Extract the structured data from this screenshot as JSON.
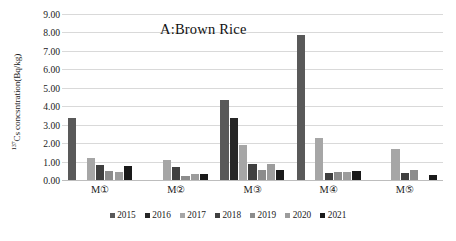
{
  "chart_data": {
    "type": "bar",
    "title": "A:Brown Rice",
    "xlabel": "",
    "ylabel": "137Cs concsntration(Bq/kg)",
    "ylabel_sup": "137",
    "ylabel_rest": "Cs concsntration(Bq/kg)",
    "categories": [
      "M①",
      "M②",
      "M③",
      "M④",
      "M⑤"
    ],
    "ylim": [
      0,
      9
    ],
    "ytick_step": 1,
    "ytick_labels": [
      "0.00",
      "1.00",
      "2.00",
      "3.00",
      "4.00",
      "5.00",
      "6.00",
      "7.00",
      "8.00",
      "9.00"
    ],
    "grid": true,
    "legend_position": "bottom",
    "series": [
      {
        "name": "2015",
        "color": "#595959",
        "values": [
          3.38,
          null,
          4.35,
          7.85,
          null
        ]
      },
      {
        "name": "2016",
        "color": "#262626",
        "values": [
          null,
          null,
          3.37,
          null,
          null
        ]
      },
      {
        "name": "2017",
        "color": "#a6a6a6",
        "values": [
          1.18,
          1.1,
          1.92,
          2.28,
          1.7
        ]
      },
      {
        "name": "2018",
        "color": "#404040",
        "values": [
          0.82,
          0.68,
          0.88,
          0.36,
          0.37
        ]
      },
      {
        "name": "2019",
        "color": "#8c8c8c",
        "values": [
          0.48,
          0.22,
          0.55,
          0.44,
          0.52
        ]
      },
      {
        "name": "2020",
        "color": "#9c9c9c",
        "values": [
          0.45,
          0.35,
          0.89,
          0.45,
          null
        ]
      },
      {
        "name": "2021",
        "color": "#1a1a1a",
        "values": [
          0.77,
          0.32,
          0.57,
          0.47,
          0.27
        ]
      }
    ]
  }
}
